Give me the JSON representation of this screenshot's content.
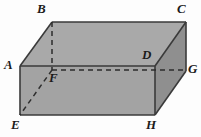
{
  "figure": {
    "shape": "rectangular prism (cuboid)",
    "background_color": "#fdfdfd",
    "faces": {
      "top_color": "#a9a9a9",
      "front_color": "#a3a3a3",
      "right_color": "#8f8f8f"
    },
    "edge_color": "#3a3a3a",
    "hidden_edge_color": "#2d2d2d",
    "vertices": [
      {
        "id": "A",
        "label": "A",
        "x": 20,
        "y": 66,
        "hidden": false,
        "label_x": 4,
        "label_y": 60
      },
      {
        "id": "B",
        "label": "B",
        "x": 52,
        "y": 22,
        "hidden": false,
        "label_x": 37,
        "label_y": 3
      },
      {
        "id": "C",
        "label": "C",
        "x": 186,
        "y": 22,
        "hidden": false,
        "label_x": 178,
        "label_y": 3
      },
      {
        "id": "D",
        "label": "D",
        "x": 155,
        "y": 66,
        "hidden": false,
        "label_x": 140,
        "label_y": 48
      },
      {
        "id": "E",
        "label": "E",
        "x": 20,
        "y": 115,
        "hidden": false,
        "label_x": 11,
        "label_y": 118
      },
      {
        "id": "F",
        "label": "F",
        "x": 52,
        "y": 70,
        "hidden": true,
        "label_x": 49,
        "label_y": 71
      },
      {
        "id": "G",
        "label": "G",
        "x": 186,
        "y": 71,
        "hidden": false,
        "label_x": 188,
        "label_y": 63
      },
      {
        "id": "H",
        "label": "H",
        "x": 155,
        "y": 115,
        "hidden": false,
        "label_x": 146,
        "label_y": 118
      }
    ],
    "solid_edges": [
      "A-B",
      "B-C",
      "C-G",
      "G-H",
      "H-E",
      "E-A",
      "A-D",
      "B-D",
      "D-C",
      "D-H"
    ],
    "hidden_edges": [
      "B-F",
      "F-E",
      "F-G"
    ]
  }
}
